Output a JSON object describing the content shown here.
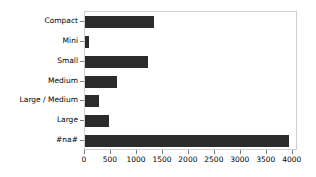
{
  "chart_data": {
    "type": "bar",
    "orientation": "horizontal",
    "title": "",
    "xlabel": "",
    "ylabel": "",
    "categories": [
      "Compact",
      "Mini",
      "Small",
      "Medium",
      "Large / Medium",
      "Large",
      "#na#"
    ],
    "values": [
      1330,
      80,
      1210,
      620,
      270,
      460,
      3920
    ],
    "xlim": [
      0,
      4100
    ],
    "xticks": [
      0,
      500,
      1000,
      1500,
      2000,
      2500,
      3000,
      3500,
      4000
    ],
    "xtick_labels": [
      "0",
      "500",
      "1000",
      "1500",
      "2000",
      "2500",
      "3000",
      "3500",
      "4000"
    ],
    "grid": false,
    "legend": null,
    "bar_color": "#2b2b2b",
    "axes_color": "#cfcfcf",
    "tick_color": "#7a7a7a",
    "text_color": "#000000",
    "background": "#ffffff"
  }
}
